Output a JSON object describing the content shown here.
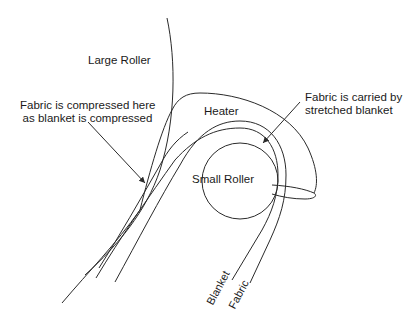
{
  "diagram": {
    "labels": {
      "large_roller": "Large Roller",
      "heater": "Heater",
      "small_roller": "Small Roller",
      "compressed_line1": "Fabric is compressed here",
      "compressed_line2": "as blanket is compressed",
      "carried_line1": "Fabric is carried by",
      "carried_line2": "stretched blanket",
      "blanket": "Blanket",
      "fabric": "Fabric"
    },
    "colors": {
      "stroke": "#2a2a2a",
      "text": "#1a1a1a",
      "background": "#ffffff"
    }
  }
}
